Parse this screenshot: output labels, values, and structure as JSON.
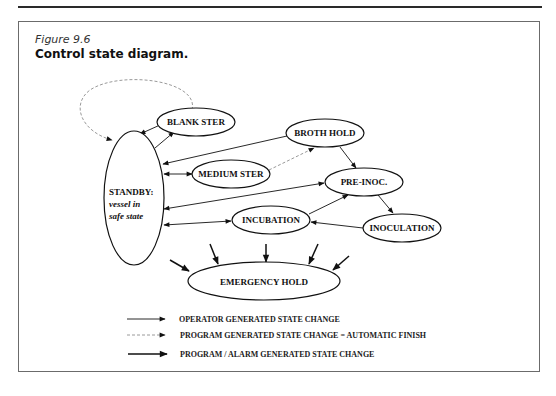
{
  "figure": {
    "number": "Figure 9.6",
    "title": "Control state diagram."
  },
  "nodes": {
    "standby": {
      "line1": "STANDBY:",
      "line2": "vessel in",
      "line3": "safe state"
    },
    "blank_ster": {
      "label": "BLANK STER"
    },
    "broth_hold": {
      "label": "BROTH HOLD"
    },
    "medium_ster": {
      "label": "MEDIUM STER"
    },
    "pre_inoc": {
      "label": "PRE-INOC."
    },
    "incubation": {
      "label": "INCUBATION"
    },
    "inoculation": {
      "label": "INOCULATION"
    },
    "emergency_hold": {
      "label": "EMERGENCY HOLD"
    }
  },
  "edges": [
    {
      "from": "BLANK STER",
      "to": "STANDBY",
      "type": "program",
      "style": "dashed"
    },
    {
      "from": "BLANK STER",
      "to": "STANDBY",
      "type": "operator"
    },
    {
      "from": "STANDBY",
      "to": "BLANK STER",
      "type": "operator"
    },
    {
      "from": "BROTH HOLD",
      "to": "STANDBY",
      "type": "operator"
    },
    {
      "from": "STANDBY",
      "to": "MEDIUM STER",
      "type": "operator",
      "bidirectional": true
    },
    {
      "from": "MEDIUM STER",
      "to": "BROTH HOLD",
      "type": "program",
      "style": "dashed"
    },
    {
      "from": "BROTH HOLD",
      "to": "PRE-INOC.",
      "type": "operator"
    },
    {
      "from": "STANDBY",
      "to": "PRE-INOC.",
      "type": "operator",
      "bidirectional": true
    },
    {
      "from": "STANDBY",
      "to": "INCUBATION",
      "type": "operator",
      "bidirectional": true
    },
    {
      "from": "INCUBATION",
      "to": "PRE-INOC.",
      "type": "operator"
    },
    {
      "from": "PRE-INOC.",
      "to": "INOCULATION",
      "type": "operator"
    },
    {
      "from": "INOCULATION",
      "to": "INCUBATION",
      "type": "operator"
    },
    {
      "from": "*",
      "to": "EMERGENCY HOLD",
      "type": "alarm",
      "count": 5
    }
  ],
  "legend": {
    "items": [
      {
        "style": "solid-thin",
        "label": "OPERATOR GENERATED STATE CHANGE"
      },
      {
        "style": "dashed",
        "label": "PROGRAM GENERATED STATE CHANGE = AUTOMATIC FINISH"
      },
      {
        "style": "solid-thick",
        "label": "PROGRAM / ALARM GENERATED STATE CHANGE"
      }
    ]
  },
  "colors": {
    "ink": "#111111",
    "dashed": "#9a9a9a",
    "frame": "#6b6b6b"
  }
}
